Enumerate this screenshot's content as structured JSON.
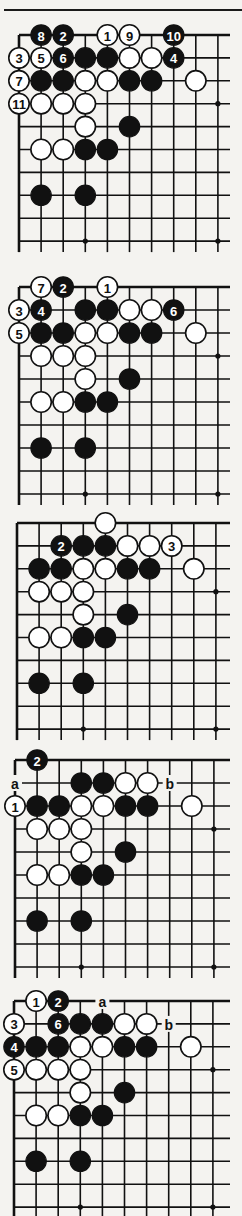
{
  "page": {
    "top_rule": true
  },
  "board_common": {
    "cols": 10,
    "rows": 10,
    "hoshi": [
      [
        3,
        9
      ],
      [
        9,
        3
      ],
      [
        9,
        9
      ]
    ],
    "colors": {
      "black": "#111111",
      "white": "#ffffff",
      "line": "#111111",
      "paper": "#f4f3f0"
    }
  },
  "diagrams": [
    {
      "id": "diagram-1",
      "origin": {
        "x": 19,
        "y": 35
      },
      "dx": 22.1,
      "dy": 22.9,
      "stones": [
        {
          "c": 1,
          "r": 0,
          "color": "black",
          "label": "8"
        },
        {
          "c": 2,
          "r": 0,
          "color": "black",
          "label": "2"
        },
        {
          "c": 4,
          "r": 0,
          "color": "white",
          "label": "1"
        },
        {
          "c": 5,
          "r": 0,
          "color": "white",
          "label": "9"
        },
        {
          "c": 7,
          "r": 0,
          "color": "black",
          "label": "10"
        },
        {
          "c": 0,
          "r": 1,
          "color": "white",
          "label": "3"
        },
        {
          "c": 1,
          "r": 1,
          "color": "white",
          "label": "5"
        },
        {
          "c": 2,
          "r": 1,
          "color": "black",
          "label": "6"
        },
        {
          "c": 3,
          "r": 1,
          "color": "black",
          "label": ""
        },
        {
          "c": 4,
          "r": 1,
          "color": "black",
          "label": ""
        },
        {
          "c": 5,
          "r": 1,
          "color": "white",
          "label": ""
        },
        {
          "c": 6,
          "r": 1,
          "color": "white",
          "label": ""
        },
        {
          "c": 7,
          "r": 1,
          "color": "black",
          "label": "4"
        },
        {
          "c": 0,
          "r": 2,
          "color": "white",
          "label": "7"
        },
        {
          "c": 1,
          "r": 2,
          "color": "black",
          "label": ""
        },
        {
          "c": 2,
          "r": 2,
          "color": "black",
          "label": ""
        },
        {
          "c": 3,
          "r": 2,
          "color": "white",
          "label": ""
        },
        {
          "c": 4,
          "r": 2,
          "color": "white",
          "label": ""
        },
        {
          "c": 5,
          "r": 2,
          "color": "black",
          "label": ""
        },
        {
          "c": 6,
          "r": 2,
          "color": "black",
          "label": ""
        },
        {
          "c": 8,
          "r": 2,
          "color": "white",
          "label": ""
        },
        {
          "c": 0,
          "r": 3,
          "color": "white",
          "label": "11"
        },
        {
          "c": 1,
          "r": 3,
          "color": "white",
          "label": ""
        },
        {
          "c": 2,
          "r": 3,
          "color": "white",
          "label": ""
        },
        {
          "c": 3,
          "r": 3,
          "color": "white",
          "label": ""
        },
        {
          "c": 3,
          "r": 4,
          "color": "white",
          "label": ""
        },
        {
          "c": 5,
          "r": 4,
          "color": "black",
          "label": ""
        },
        {
          "c": 1,
          "r": 5,
          "color": "white",
          "label": ""
        },
        {
          "c": 2,
          "r": 5,
          "color": "white",
          "label": ""
        },
        {
          "c": 3,
          "r": 5,
          "color": "black",
          "label": ""
        },
        {
          "c": 4,
          "r": 5,
          "color": "black",
          "label": ""
        },
        {
          "c": 1,
          "r": 7,
          "color": "black",
          "label": ""
        },
        {
          "c": 3,
          "r": 7,
          "color": "black",
          "label": ""
        }
      ],
      "marks": []
    },
    {
      "id": "diagram-2",
      "origin": {
        "x": 19,
        "y": 287
      },
      "dx": 22.1,
      "dy": 23.0,
      "stones": [
        {
          "c": 1,
          "r": 0,
          "color": "white",
          "label": "7"
        },
        {
          "c": 2,
          "r": 0,
          "color": "black",
          "label": "2"
        },
        {
          "c": 4,
          "r": 0,
          "color": "white",
          "label": "1"
        },
        {
          "c": 0,
          "r": 1,
          "color": "white",
          "label": "3"
        },
        {
          "c": 1,
          "r": 1,
          "color": "black",
          "label": "4"
        },
        {
          "c": 3,
          "r": 1,
          "color": "black",
          "label": ""
        },
        {
          "c": 4,
          "r": 1,
          "color": "black",
          "label": ""
        },
        {
          "c": 5,
          "r": 1,
          "color": "white",
          "label": ""
        },
        {
          "c": 6,
          "r": 1,
          "color": "white",
          "label": ""
        },
        {
          "c": 7,
          "r": 1,
          "color": "black",
          "label": "6"
        },
        {
          "c": 0,
          "r": 2,
          "color": "white",
          "label": "5"
        },
        {
          "c": 1,
          "r": 2,
          "color": "black",
          "label": ""
        },
        {
          "c": 2,
          "r": 2,
          "color": "black",
          "label": ""
        },
        {
          "c": 3,
          "r": 2,
          "color": "white",
          "label": ""
        },
        {
          "c": 4,
          "r": 2,
          "color": "white",
          "label": ""
        },
        {
          "c": 5,
          "r": 2,
          "color": "black",
          "label": ""
        },
        {
          "c": 6,
          "r": 2,
          "color": "black",
          "label": ""
        },
        {
          "c": 8,
          "r": 2,
          "color": "white",
          "label": ""
        },
        {
          "c": 1,
          "r": 3,
          "color": "white",
          "label": ""
        },
        {
          "c": 2,
          "r": 3,
          "color": "white",
          "label": ""
        },
        {
          "c": 3,
          "r": 3,
          "color": "white",
          "label": ""
        },
        {
          "c": 3,
          "r": 4,
          "color": "white",
          "label": ""
        },
        {
          "c": 5,
          "r": 4,
          "color": "black",
          "label": ""
        },
        {
          "c": 1,
          "r": 5,
          "color": "white",
          "label": ""
        },
        {
          "c": 2,
          "r": 5,
          "color": "white",
          "label": ""
        },
        {
          "c": 3,
          "r": 5,
          "color": "black",
          "label": ""
        },
        {
          "c": 4,
          "r": 5,
          "color": "black",
          "label": ""
        },
        {
          "c": 1,
          "r": 7,
          "color": "black",
          "label": ""
        },
        {
          "c": 3,
          "r": 7,
          "color": "black",
          "label": ""
        }
      ],
      "marks": []
    },
    {
      "id": "diagram-3",
      "origin": {
        "x": 17,
        "y": 523
      },
      "dx": 22.1,
      "dy": 22.9,
      "stones": [
        {
          "c": 4,
          "r": 0,
          "color": "white",
          "label": ""
        },
        {
          "c": 2,
          "r": 1,
          "color": "black",
          "label": "2"
        },
        {
          "c": 3,
          "r": 1,
          "color": "black",
          "label": ""
        },
        {
          "c": 4,
          "r": 1,
          "color": "black",
          "label": ""
        },
        {
          "c": 5,
          "r": 1,
          "color": "white",
          "label": ""
        },
        {
          "c": 6,
          "r": 1,
          "color": "white",
          "label": ""
        },
        {
          "c": 7,
          "r": 1,
          "color": "white",
          "label": "3"
        },
        {
          "c": 1,
          "r": 2,
          "color": "black",
          "label": ""
        },
        {
          "c": 2,
          "r": 2,
          "color": "black",
          "label": ""
        },
        {
          "c": 3,
          "r": 2,
          "color": "white",
          "label": ""
        },
        {
          "c": 4,
          "r": 2,
          "color": "white",
          "label": ""
        },
        {
          "c": 5,
          "r": 2,
          "color": "black",
          "label": ""
        },
        {
          "c": 6,
          "r": 2,
          "color": "black",
          "label": ""
        },
        {
          "c": 8,
          "r": 2,
          "color": "white",
          "label": ""
        },
        {
          "c": 1,
          "r": 3,
          "color": "white",
          "label": ""
        },
        {
          "c": 2,
          "r": 3,
          "color": "white",
          "label": ""
        },
        {
          "c": 3,
          "r": 3,
          "color": "white",
          "label": ""
        },
        {
          "c": 3,
          "r": 4,
          "color": "white",
          "label": ""
        },
        {
          "c": 5,
          "r": 4,
          "color": "black",
          "label": ""
        },
        {
          "c": 1,
          "r": 5,
          "color": "white",
          "label": ""
        },
        {
          "c": 2,
          "r": 5,
          "color": "white",
          "label": ""
        },
        {
          "c": 3,
          "r": 5,
          "color": "black",
          "label": ""
        },
        {
          "c": 4,
          "r": 5,
          "color": "black",
          "label": ""
        },
        {
          "c": 1,
          "r": 7,
          "color": "black",
          "label": ""
        },
        {
          "c": 3,
          "r": 7,
          "color": "black",
          "label": ""
        }
      ],
      "marks": []
    },
    {
      "id": "diagram-4",
      "origin": {
        "x": 15,
        "y": 760
      },
      "dx": 22.1,
      "dy": 23.0,
      "stones": [
        {
          "c": 1,
          "r": 0,
          "color": "black",
          "label": "2"
        },
        {
          "c": 3,
          "r": 1,
          "color": "black",
          "label": ""
        },
        {
          "c": 4,
          "r": 1,
          "color": "black",
          "label": ""
        },
        {
          "c": 5,
          "r": 1,
          "color": "white",
          "label": ""
        },
        {
          "c": 6,
          "r": 1,
          "color": "white",
          "label": ""
        },
        {
          "c": 0,
          "r": 2,
          "color": "white",
          "label": "1"
        },
        {
          "c": 1,
          "r": 2,
          "color": "black",
          "label": ""
        },
        {
          "c": 2,
          "r": 2,
          "color": "black",
          "label": ""
        },
        {
          "c": 3,
          "r": 2,
          "color": "white",
          "label": ""
        },
        {
          "c": 4,
          "r": 2,
          "color": "white",
          "label": ""
        },
        {
          "c": 5,
          "r": 2,
          "color": "black",
          "label": ""
        },
        {
          "c": 6,
          "r": 2,
          "color": "black",
          "label": ""
        },
        {
          "c": 8,
          "r": 2,
          "color": "white",
          "label": ""
        },
        {
          "c": 1,
          "r": 3,
          "color": "white",
          "label": ""
        },
        {
          "c": 2,
          "r": 3,
          "color": "white",
          "label": ""
        },
        {
          "c": 3,
          "r": 3,
          "color": "white",
          "label": ""
        },
        {
          "c": 3,
          "r": 4,
          "color": "white",
          "label": ""
        },
        {
          "c": 5,
          "r": 4,
          "color": "black",
          "label": ""
        },
        {
          "c": 1,
          "r": 5,
          "color": "white",
          "label": ""
        },
        {
          "c": 2,
          "r": 5,
          "color": "white",
          "label": ""
        },
        {
          "c": 3,
          "r": 5,
          "color": "black",
          "label": ""
        },
        {
          "c": 4,
          "r": 5,
          "color": "black",
          "label": ""
        },
        {
          "c": 1,
          "r": 7,
          "color": "black",
          "label": ""
        },
        {
          "c": 3,
          "r": 7,
          "color": "black",
          "label": ""
        }
      ],
      "marks": [
        {
          "c": 0,
          "r": 1,
          "label": "a"
        },
        {
          "c": 7,
          "r": 1,
          "label": "b"
        }
      ]
    },
    {
      "id": "diagram-5",
      "origin": {
        "x": 14,
        "y": 1001
      },
      "dx": 22.1,
      "dy": 22.9,
      "stones": [
        {
          "c": 1,
          "r": 0,
          "color": "white",
          "label": "1"
        },
        {
          "c": 2,
          "r": 0,
          "color": "black",
          "label": "2"
        },
        {
          "c": 0,
          "r": 1,
          "color": "white",
          "label": "3"
        },
        {
          "c": 2,
          "r": 1,
          "color": "black",
          "label": "6"
        },
        {
          "c": 3,
          "r": 1,
          "color": "black",
          "label": ""
        },
        {
          "c": 4,
          "r": 1,
          "color": "black",
          "label": ""
        },
        {
          "c": 5,
          "r": 1,
          "color": "white",
          "label": ""
        },
        {
          "c": 6,
          "r": 1,
          "color": "white",
          "label": ""
        },
        {
          "c": 0,
          "r": 2,
          "color": "black",
          "label": "4"
        },
        {
          "c": 1,
          "r": 2,
          "color": "black",
          "label": ""
        },
        {
          "c": 2,
          "r": 2,
          "color": "black",
          "label": ""
        },
        {
          "c": 3,
          "r": 2,
          "color": "white",
          "label": ""
        },
        {
          "c": 4,
          "r": 2,
          "color": "white",
          "label": ""
        },
        {
          "c": 5,
          "r": 2,
          "color": "black",
          "label": ""
        },
        {
          "c": 6,
          "r": 2,
          "color": "black",
          "label": ""
        },
        {
          "c": 8,
          "r": 2,
          "color": "white",
          "label": ""
        },
        {
          "c": 0,
          "r": 3,
          "color": "white",
          "label": "5"
        },
        {
          "c": 1,
          "r": 3,
          "color": "white",
          "label": ""
        },
        {
          "c": 2,
          "r": 3,
          "color": "white",
          "label": ""
        },
        {
          "c": 3,
          "r": 3,
          "color": "white",
          "label": ""
        },
        {
          "c": 3,
          "r": 4,
          "color": "white",
          "label": ""
        },
        {
          "c": 5,
          "r": 4,
          "color": "black",
          "label": ""
        },
        {
          "c": 1,
          "r": 5,
          "color": "white",
          "label": ""
        },
        {
          "c": 2,
          "r": 5,
          "color": "white",
          "label": ""
        },
        {
          "c": 3,
          "r": 5,
          "color": "black",
          "label": ""
        },
        {
          "c": 4,
          "r": 5,
          "color": "black",
          "label": ""
        },
        {
          "c": 1,
          "r": 7,
          "color": "black",
          "label": ""
        },
        {
          "c": 3,
          "r": 7,
          "color": "black",
          "label": ""
        }
      ],
      "marks": [
        {
          "c": 4,
          "r": 0,
          "label": "a"
        },
        {
          "c": 7,
          "r": 1,
          "label": "b"
        }
      ]
    }
  ]
}
